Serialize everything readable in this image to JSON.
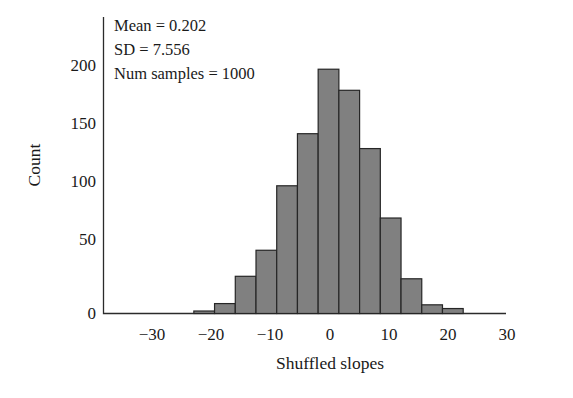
{
  "chart_data": {
    "type": "bar",
    "title": "",
    "subtitle": "",
    "xlabel": "Shuffled slopes",
    "ylabel": "Count",
    "xlim": [
      -36,
      36
    ],
    "ylim": [
      0,
      212
    ],
    "grid": false,
    "legend": "none",
    "bin_width": 3.5,
    "bin_left_edges": [
      -23.0,
      -19.5,
      -16.0,
      -12.5,
      -9.0,
      -5.5,
      -2.0,
      1.5,
      5.0,
      8.5,
      12.0,
      15.5,
      19.0
    ],
    "bin_centers": [
      -21.25,
      -17.75,
      -14.25,
      -10.75,
      -7.25,
      -3.75,
      -0.25,
      3.25,
      6.75,
      10.25,
      13.75,
      17.25,
      20.75
    ],
    "categories": [
      "-23.0",
      "-19.5",
      "-16.0",
      "-12.5",
      "-9.0",
      "-5.5",
      "-2.0",
      "1.5",
      "5.0",
      "8.5",
      "12.0",
      "15.5",
      "19.0"
    ],
    "values": [
      2,
      8,
      30,
      51,
      103,
      145,
      197,
      180,
      133,
      77,
      28,
      7,
      4
    ],
    "x_ticks": [
      -30,
      -20,
      -10,
      0,
      10,
      20,
      30
    ],
    "x_tick_labels": [
      "−30",
      "−20",
      "−10",
      "0",
      "10",
      "20",
      "30"
    ],
    "y_ticks": [
      0,
      50,
      100,
      150,
      200
    ],
    "y_tick_labels": [
      "0",
      "50",
      "100",
      "150",
      "200"
    ],
    "bar_color": "#808080",
    "bar_edge_color": "#262626",
    "axis_color": "#2b2b2b",
    "background_color": "#ffffff",
    "annotations": [
      "Mean = 0.202",
      "SD = 7.556",
      "Num samples = 1000"
    ]
  },
  "stats": {
    "mean_line": "Mean = 0.202",
    "sd_line": "SD = 7.556",
    "num_samples_line": "Num samples = 1000"
  },
  "axes": {
    "x_title": "Shuffled slopes",
    "y_title": "Count",
    "y_labels": [
      "200",
      "150",
      "100",
      "50",
      "0"
    ],
    "x_labels": [
      "−30",
      "−20",
      "−10",
      "0",
      "10",
      "20",
      "30"
    ]
  }
}
